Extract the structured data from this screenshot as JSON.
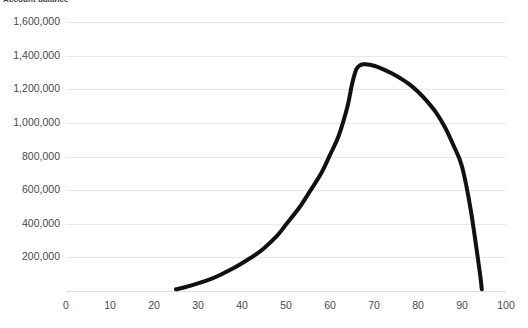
{
  "chart_data": {
    "type": "line",
    "title": "Account balance",
    "xlabel": "",
    "ylabel": "",
    "xlim": [
      0,
      100
    ],
    "ylim": [
      0,
      1600000
    ],
    "grid": true,
    "legend": "none",
    "x_ticks": [
      0,
      10,
      20,
      30,
      40,
      50,
      60,
      70,
      80,
      90,
      100
    ],
    "x_tick_labels": [
      "0",
      "10",
      "20",
      "30",
      "40",
      "50",
      "60",
      "70",
      "80",
      "90",
      "100"
    ],
    "y_ticks": [
      200000,
      400000,
      600000,
      800000,
      1000000,
      1200000,
      1400000,
      1600000
    ],
    "y_tick_labels": [
      "200,000",
      "400,000",
      "600,000",
      "800,000",
      "1,000,000",
      "1,200,000",
      "1,400,000",
      "1,600,000"
    ],
    "series": [
      {
        "name": "Account balance",
        "color": "#111111",
        "line_width": 4,
        "x": [
          25,
          27,
          30,
          33,
          35,
          38,
          40,
          43,
          45,
          48,
          50,
          53,
          55,
          58,
          60,
          62,
          64,
          65,
          66,
          67,
          68,
          70,
          72,
          74,
          76,
          78,
          80,
          82,
          84,
          86,
          88,
          90,
          92,
          94,
          94.5
        ],
        "values": [
          10000,
          22000,
          45000,
          72000,
          95000,
          135000,
          165000,
          215000,
          255000,
          330000,
          395000,
          495000,
          575000,
          700000,
          810000,
          925000,
          1100000,
          1230000,
          1320000,
          1345000,
          1348000,
          1340000,
          1320000,
          1295000,
          1265000,
          1230000,
          1185000,
          1130000,
          1065000,
          980000,
          870000,
          740000,
          480000,
          120000,
          10000
        ]
      }
    ],
    "peak": {
      "x": 67,
      "value": 1345000
    },
    "start": {
      "x": 25,
      "value": 10000
    },
    "end": {
      "x": 94.5,
      "value": 10000
    }
  },
  "colors": {
    "series_line": "#111111",
    "gridline": "#e9e9e9",
    "axis_line": "#dcdcdc",
    "tick_text": "#4a4a4a",
    "title_text": "#3f3f3f",
    "background": "#ffffff"
  }
}
